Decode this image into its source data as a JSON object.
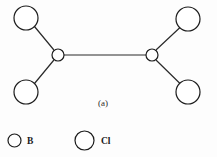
{
  "figure": {
    "caption": "(a)",
    "background_color": "#fdfdfd",
    "stroke_color": "#1c1c1c",
    "bond_color": "#2a2a2a"
  },
  "molecule": {
    "name": "B2Cl4",
    "atoms": [
      {
        "id": "cl-top-left",
        "element": "Cl",
        "cx": 26,
        "cy": 18,
        "r": 12
      },
      {
        "id": "cl-bottom-left",
        "element": "Cl",
        "cx": 26,
        "cy": 92,
        "r": 12
      },
      {
        "id": "b-left",
        "element": "B",
        "cx": 58,
        "cy": 55,
        "r": 6
      },
      {
        "id": "b-right",
        "element": "B",
        "cx": 152,
        "cy": 55,
        "r": 6
      },
      {
        "id": "cl-top-right",
        "element": "Cl",
        "cx": 188,
        "cy": 19,
        "r": 12
      },
      {
        "id": "cl-bottom-right",
        "element": "Cl",
        "cx": 188,
        "cy": 92,
        "r": 12
      }
    ],
    "bonds": [
      {
        "id": "bond-cl-top-left-b-left",
        "from": "cl-top-left",
        "to": "b-left",
        "x1": 34.5,
        "y1": 26.5,
        "x2": 53.5,
        "y2": 49.5
      },
      {
        "id": "bond-cl-bottom-left-b-left",
        "from": "cl-bottom-left",
        "to": "b-left",
        "x1": 34.5,
        "y1": 83.5,
        "x2": 53.5,
        "y2": 60.5
      },
      {
        "id": "bond-b-left-b-right",
        "from": "b-left",
        "to": "b-right",
        "x1": 64,
        "y1": 55,
        "x2": 146,
        "y2": 55
      },
      {
        "id": "bond-b-right-cl-top-right",
        "from": "b-right",
        "to": "cl-top-right",
        "x1": 156.5,
        "y1": 49.5,
        "x2": 180,
        "y2": 27.5
      },
      {
        "id": "bond-b-right-cl-bottom-right",
        "from": "b-right",
        "to": "cl-bottom-right",
        "x1": 156.5,
        "y1": 60.5,
        "x2": 180,
        "y2": 83.5
      }
    ]
  },
  "legend": {
    "items": [
      {
        "id": "legend-b",
        "label": "B",
        "r": 6.5,
        "cx": 14.5,
        "cy": 140.5,
        "label_x": 27
      },
      {
        "id": "legend-cl",
        "label": "Cl",
        "r": 9.5,
        "cx": 84.5,
        "cy": 140.5,
        "label_x": 101
      }
    ]
  }
}
